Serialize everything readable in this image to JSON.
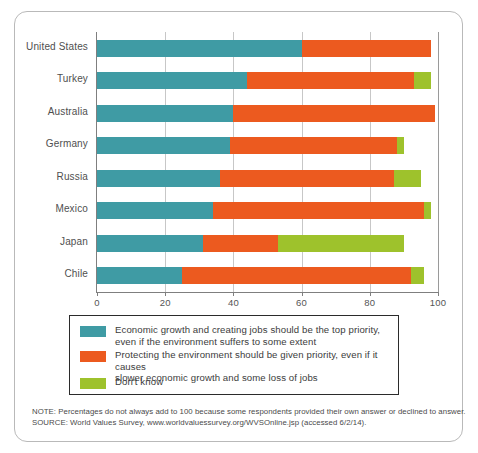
{
  "chart_data": {
    "type": "bar",
    "orientation": "horizontal",
    "stacked": true,
    "title": "",
    "xlabel": "",
    "ylabel": "",
    "xlim": [
      0,
      100
    ],
    "xticks": [
      0,
      20,
      40,
      60,
      80,
      100
    ],
    "xtick_labels": [
      "0",
      "20",
      "40",
      "60",
      "80",
      "100"
    ],
    "grid": "vertical",
    "legend_position": "below-plot",
    "categories": [
      "United States",
      "Turkey",
      "Australia",
      "Germany",
      "Russia",
      "Mexico",
      "Japan",
      "Chile"
    ],
    "series": [
      {
        "name": "Economic growth and creating jobs should be the top priority, even if the environment suffers to some extent",
        "color": "#3f9ba4",
        "values": [
          60,
          44,
          40,
          39,
          36,
          34,
          31,
          25
        ]
      },
      {
        "name": "Protecting the environment should be given priority, even if it causes slower economic growth and some loss of jobs",
        "color": "#ec5a1f",
        "values": [
          38,
          49,
          59,
          49,
          51,
          62,
          22,
          67
        ]
      },
      {
        "name": "Don't know",
        "color": "#9ec22c",
        "values": [
          0,
          5,
          0,
          2,
          8,
          2,
          37,
          4
        ]
      }
    ],
    "totals": [
      98,
      98,
      99,
      90,
      95,
      98,
      90,
      96
    ]
  },
  "legend": {
    "items": [
      {
        "swatch_name": "legend-swatch-economic-growth",
        "color": "#3f9ba4",
        "line1": "Economic growth and creating jobs should be the top priority,",
        "line2": "even if the environment suffers to some extent"
      },
      {
        "swatch_name": "legend-swatch-protect-environment",
        "color": "#ec5a1f",
        "line1": "Protecting the environment should be given priority, even if it causes",
        "line2": "slower economic growth and some loss of jobs"
      },
      {
        "swatch_name": "legend-swatch-dont-know",
        "color": "#9ec22c",
        "line1": "Don't know",
        "line2": ""
      }
    ]
  },
  "footnotes": {
    "note": "NOTE: Percentages do not always add to 100 because some respondents provided their own answer or declined to answer.",
    "source": "SOURCE: World Values Survey, www.worldvaluessurvey.org/WVSOnline.jsp (accessed 6/2/14)."
  }
}
